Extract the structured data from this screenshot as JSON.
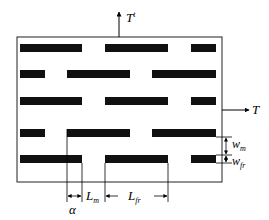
{
  "diagram": {
    "type": "staggered-fiber-composite-schematic",
    "labels": {
      "top_traction": "T",
      "top_traction_sup": "t",
      "right_traction": "T",
      "alpha": "α",
      "L_m": "L",
      "L_m_sub": "m",
      "L_fr": "L",
      "L_fr_sub": "fr",
      "w_m": "w",
      "w_m_sub": "m",
      "w_fr": "w",
      "w_fr_sub": "fr"
    },
    "box": {
      "x": 17,
      "y": 37,
      "w": 205,
      "h": 145
    },
    "rows": [
      {
        "y": 44,
        "h": 8,
        "bars": [
          [
            20,
            82
          ],
          [
            105,
            168
          ],
          [
            191,
            216
          ]
        ]
      },
      {
        "y": 70,
        "h": 8,
        "bars": [
          [
            20,
            45
          ],
          [
            67,
            130
          ],
          [
            152,
            216
          ]
        ]
      },
      {
        "y": 97,
        "h": 8,
        "bars": [
          [
            20,
            82
          ],
          [
            105,
            168
          ],
          [
            191,
            216
          ]
        ]
      },
      {
        "y": 129,
        "h": 8,
        "bars": [
          [
            20,
            45
          ],
          [
            67,
            130
          ],
          [
            152,
            216
          ]
        ]
      },
      {
        "y": 155,
        "h": 8,
        "bars": [
          [
            20,
            82
          ],
          [
            105,
            168
          ],
          [
            191,
            216
          ]
        ]
      }
    ],
    "colors": {
      "bar": "#111111",
      "line": "#222222"
    }
  }
}
